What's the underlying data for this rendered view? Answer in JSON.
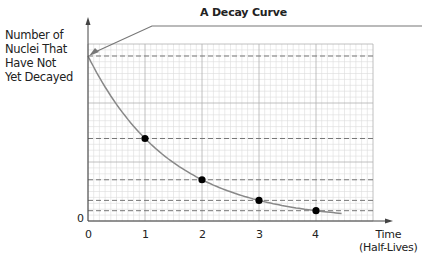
{
  "title": "A Decay Curve",
  "y_axis": {
    "label_lines": [
      "Number of",
      "Nuclei That",
      "Have Not",
      "Yet Decayed"
    ],
    "zero_label": "0"
  },
  "x_axis": {
    "title_lines": [
      "Time",
      "(Half-Lives)"
    ],
    "tick_labels": [
      "0",
      "1",
      "2",
      "3",
      "4"
    ]
  },
  "colors": {
    "curve": "#888888",
    "points": "#000000",
    "dashed": "#777777",
    "major_grid": "#b0b0b0",
    "minor_grid": "#dcdcdc",
    "axis": "#444444"
  },
  "chart_data": {
    "type": "line",
    "title": "A Decay Curve",
    "xlabel": "Time (Half-Lives)",
    "ylabel": "Number of Nuclei That Have Not Yet Decayed",
    "x": [
      0,
      1,
      2,
      3,
      4
    ],
    "values": [
      1.0,
      0.5,
      0.25,
      0.125,
      0.0625
    ],
    "marked_points": [
      [
        1,
        0.5
      ],
      [
        2,
        0.25
      ],
      [
        3,
        0.125
      ],
      [
        4,
        0.0625
      ]
    ],
    "dashed_reference_levels": [
      1.0,
      0.5,
      0.25,
      0.125,
      0.0625
    ],
    "xlim": [
      0,
      5
    ],
    "ylim": [
      0,
      1.2
    ],
    "grid": true,
    "annotation": "Arrow from title line pointing to initial value (t=0)"
  }
}
